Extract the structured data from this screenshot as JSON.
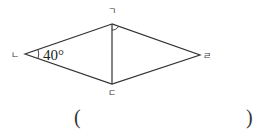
{
  "diagram": {
    "type": "rhombus",
    "vertices": [
      {
        "id": "top",
        "label": "ㄱ",
        "x": 112,
        "y": 24
      },
      {
        "id": "left",
        "label": "ㄴ",
        "x": 25,
        "y": 54
      },
      {
        "id": "bottom",
        "label": "ㄷ",
        "x": 112,
        "y": 84
      },
      {
        "id": "right",
        "label": "ㄹ",
        "x": 200,
        "y": 55
      }
    ],
    "angle_label": "40°",
    "angle_at": "ㄴ",
    "marked_angle_at": "ㄱ",
    "line_color": "#333333"
  },
  "answer": {
    "open_paren": "(",
    "close_paren": ")"
  }
}
